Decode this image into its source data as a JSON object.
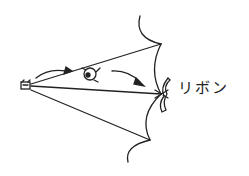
{
  "diagram": {
    "label": "リボン",
    "stroke_color": "#222222",
    "background": "#ffffff",
    "elements": {
      "left_figure": "small-person-figure",
      "middle_figure": "face-character",
      "arrows": 2,
      "ribbon": "ribbon-shape"
    }
  }
}
